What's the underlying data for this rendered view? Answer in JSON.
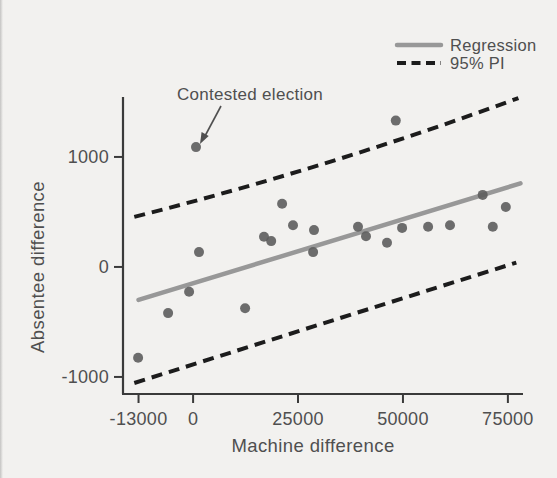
{
  "figure": {
    "background": "#f2f1ef",
    "legend": [
      {
        "label": "Regression",
        "style": "solid"
      },
      {
        "label": "95% PI",
        "style": "dashed"
      }
    ]
  },
  "chart_data": {
    "type": "scatter",
    "title": "",
    "xlabel": "Machine difference",
    "ylabel": "Absentee difference",
    "xlim": [
      -16700,
      78600
    ],
    "ylim": [
      -1155,
      1545
    ],
    "x_ticks": [
      {
        "value": -13000,
        "label": "-13000"
      },
      {
        "value": 0,
        "label": "0"
      },
      {
        "value": 25000,
        "label": "25000"
      },
      {
        "value": 50000,
        "label": "50000"
      },
      {
        "value": 75000,
        "label": "75000"
      }
    ],
    "y_ticks": [
      {
        "value": -1000,
        "label": "-1000"
      },
      {
        "value": 0,
        "label": "0"
      },
      {
        "value": 1000,
        "label": "1000"
      }
    ],
    "annotation": "Contested election",
    "contested_point": {
      "x": 700,
      "y": 1090
    },
    "points": [
      [
        48300,
        1330
      ],
      [
        21200,
        575
      ],
      [
        16900,
        275
      ],
      [
        18600,
        235
      ],
      [
        23800,
        380
      ],
      [
        28800,
        335
      ],
      [
        1400,
        135
      ],
      [
        28600,
        135
      ],
      [
        39300,
        365
      ],
      [
        41200,
        280
      ],
      [
        46200,
        220
      ],
      [
        49800,
        355
      ],
      [
        56000,
        365
      ],
      [
        61200,
        380
      ],
      [
        69000,
        655
      ],
      [
        71400,
        365
      ],
      [
        74500,
        545
      ],
      [
        -950,
        -225
      ],
      [
        -5950,
        -420
      ],
      [
        12400,
        -375
      ],
      [
        -13100,
        -825
      ]
    ],
    "regression_line": {
      "name": "Regression",
      "points": [
        [
          -13000,
          -300
        ],
        [
          78000,
          760
        ]
      ]
    },
    "pi_upper": {
      "name": "95% PI upper bound",
      "points": [
        [
          -14000,
          455
        ],
        [
          32500,
          955
        ],
        [
          77500,
          1535
        ]
      ]
    },
    "pi_lower": {
      "name": "95% PI lower bound",
      "points": [
        [
          -14000,
          -1055
        ],
        [
          35000,
          -465
        ],
        [
          77000,
          40
        ]
      ]
    },
    "legend_position": "top-right",
    "grid": false,
    "colors": {
      "points": "#5d5d5d",
      "regression": "#989898",
      "pi": "#1c1c1c",
      "axis": "#3a3a3a",
      "text": "#4f4f4f",
      "background": "#f2f1ef"
    }
  }
}
